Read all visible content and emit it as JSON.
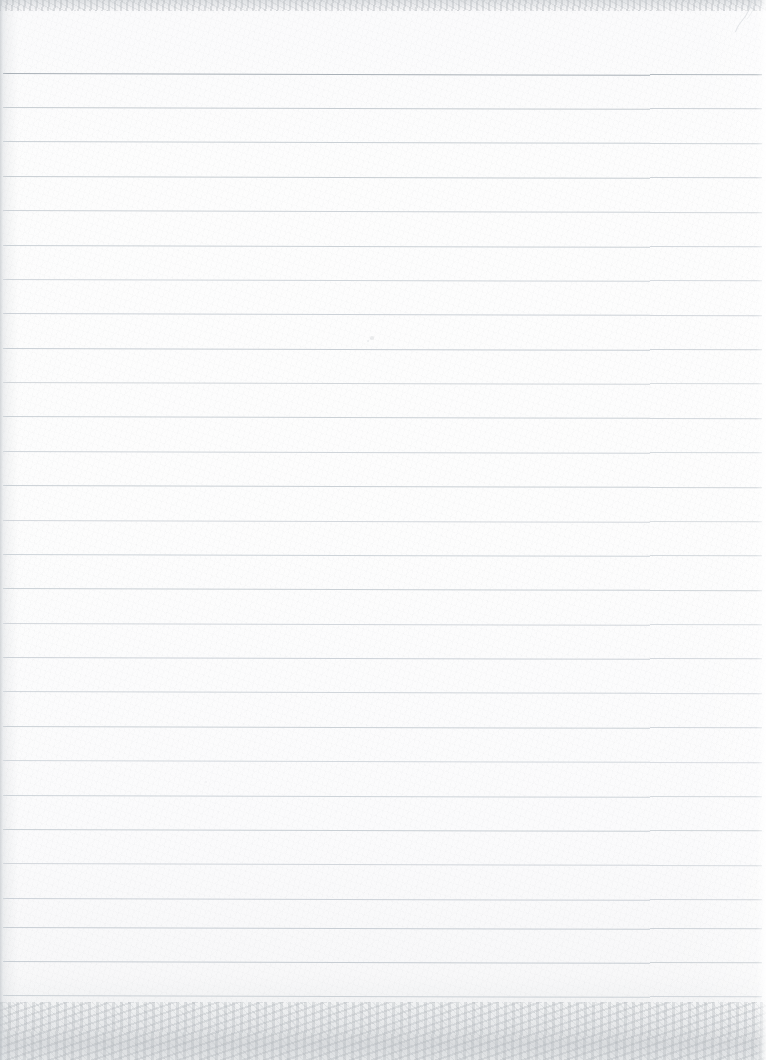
{
  "document": {
    "kind": "scanned-image",
    "subject": "blank ruled notebook page",
    "title": "Scanned Blank Ruled Notebook Page",
    "text_content": "",
    "handwriting_present": "no",
    "printed_text_present": "no",
    "width_px": 766,
    "height_px": 1060,
    "orientation": "portrait"
  },
  "paper": {
    "background_color": "#fafafb",
    "highlight_color": "#fdfdfd",
    "shadow_color": "#eceded",
    "texture": "fibrous paper grain",
    "left_edge_color": "#bec3c8",
    "top_edge_color": "#c6cace",
    "bottom_edge_color": "#c4c8cd"
  },
  "ruling": {
    "type": "horizontal-ruled",
    "line_count": 28,
    "first_line_y": 72.6,
    "spacing_px": 34.37,
    "line_thickness_px": 1,
    "line_start_x": 3,
    "line_end_x": 762,
    "default_color": "#ced3d8",
    "emphasis_color": "#a9b0b7",
    "tilt_deg": 0.16,
    "scan_seam_x": 650,
    "scan_seam_offset_px": 1.4,
    "lines": [
      {
        "index": 1,
        "y": 72.6,
        "color": "#a9b0b7",
        "opacity": 1.0,
        "note": "top rule, darkest"
      },
      {
        "index": 2,
        "y": 107.0,
        "color": "#c3c9cf",
        "opacity": 0.95
      },
      {
        "index": 3,
        "y": 141.4,
        "color": "#c6ccd2",
        "opacity": 0.93
      },
      {
        "index": 4,
        "y": 175.8,
        "color": "#c4cad0",
        "opacity": 0.95
      },
      {
        "index": 5,
        "y": 210.1,
        "color": "#c9ced4",
        "opacity": 0.9
      },
      {
        "index": 6,
        "y": 244.5,
        "color": "#c7cdd3",
        "opacity": 0.92
      },
      {
        "index": 7,
        "y": 278.9,
        "color": "#cbd0d6",
        "opacity": 0.88
      },
      {
        "index": 8,
        "y": 313.3,
        "color": "#c8ced4",
        "opacity": 0.91
      },
      {
        "index": 9,
        "y": 347.6,
        "color": "#c5cbd1",
        "opacity": 0.94
      },
      {
        "index": 10,
        "y": 382.0,
        "color": "#ccd1d6",
        "opacity": 0.87
      },
      {
        "index": 11,
        "y": 416.4,
        "color": "#c7cdd3",
        "opacity": 0.92
      },
      {
        "index": 12,
        "y": 450.8,
        "color": "#cad0d5",
        "opacity": 0.89
      },
      {
        "index": 13,
        "y": 485.1,
        "color": "#c6ccd2",
        "opacity": 0.93
      },
      {
        "index": 14,
        "y": 519.5,
        "color": "#cdd2d7",
        "opacity": 0.86
      },
      {
        "index": 15,
        "y": 553.9,
        "color": "#c9cfd5",
        "opacity": 0.9
      },
      {
        "index": 16,
        "y": 588.3,
        "color": "#c6ccd2",
        "opacity": 0.93
      },
      {
        "index": 17,
        "y": 622.6,
        "color": "#ccd1d7",
        "opacity": 0.87
      },
      {
        "index": 18,
        "y": 657.0,
        "color": "#c8ced4",
        "opacity": 0.91
      },
      {
        "index": 19,
        "y": 691.4,
        "color": "#cbd0d6",
        "opacity": 0.88
      },
      {
        "index": 20,
        "y": 725.8,
        "color": "#c7cdd3",
        "opacity": 0.92
      },
      {
        "index": 21,
        "y": 760.1,
        "color": "#cdd2d8",
        "opacity": 0.85
      },
      {
        "index": 22,
        "y": 794.5,
        "color": "#c9cfd5",
        "opacity": 0.9
      },
      {
        "index": 23,
        "y": 828.9,
        "color": "#c6ccd2",
        "opacity": 0.93
      },
      {
        "index": 24,
        "y": 863.3,
        "color": "#ccd1d7",
        "opacity": 0.87
      },
      {
        "index": 25,
        "y": 897.6,
        "color": "#c8ced4",
        "opacity": 0.91
      },
      {
        "index": 26,
        "y": 927.0,
        "color": "#c5cbd1",
        "opacity": 0.94
      },
      {
        "index": 27,
        "y": 961.0,
        "color": "#c4cad0",
        "opacity": 0.94
      },
      {
        "index": 28,
        "y": 994.5,
        "color": "#c7cdd3",
        "opacity": 0.9
      }
    ]
  },
  "artifacts": {
    "corner_curl": {
      "label": "folded page corner",
      "x": 748,
      "y": 0,
      "width": 26,
      "height": 34,
      "color": "#d2d6da"
    },
    "flecks": [
      {
        "label": "paper-fleck",
        "x": 370,
        "y": 336,
        "size": 3.5,
        "opacity": 0.42
      },
      {
        "label": "paper-fleck",
        "x": 367,
        "y": 340,
        "size": 2.0,
        "opacity": 0.3
      },
      {
        "label": "paper-fleck",
        "x": 205,
        "y": 781,
        "size": 1.6,
        "opacity": 0.22
      },
      {
        "label": "paper-fleck",
        "x": 612,
        "y": 470,
        "size": 1.4,
        "opacity": 0.2
      }
    ]
  }
}
